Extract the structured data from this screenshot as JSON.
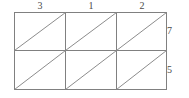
{
  "diagram": {
    "type": "grid-of-triangulated-rectangles",
    "geometry": {
      "rows": 2,
      "columns": 3,
      "cells_total": 6,
      "triangles_total": 12,
      "diagonal_direction": "bottom-left-to-top-right",
      "stroke_color": "#808080",
      "background_color": "#ffffff",
      "outer_rect": {
        "x": 14,
        "y": 12,
        "width": 153,
        "height": 78
      },
      "column_x_positions": [
        14,
        65,
        116,
        167
      ],
      "row_y_positions": [
        12,
        50,
        90
      ]
    },
    "column_labels": [
      {
        "name": "column-1-length",
        "value": "3",
        "center_x": 40
      },
      {
        "name": "column-2-length",
        "value": "1",
        "center_x": 91
      },
      {
        "name": "column-3-length",
        "value": "2",
        "center_x": 142
      }
    ],
    "row_labels": [
      {
        "name": "row-1-height",
        "value": "7",
        "center_y": 31
      },
      {
        "name": "row-2-height",
        "value": "5",
        "center_y": 70
      }
    ]
  }
}
